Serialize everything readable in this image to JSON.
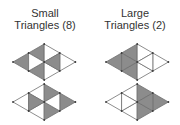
{
  "colors": {
    "shaded": "#8c8c8c",
    "unshaded": "#ffffff",
    "edge": "#707070",
    "vertex": "#3a3a3a",
    "text": "#333333"
  },
  "panels": [
    {
      "title": "Small",
      "subtitle": "Triangles (8)",
      "count": 8,
      "figures": [
        {
          "description": "rhombus of 8 small triangles; shaded: left tip, upper-left, lower-left, right-middle",
          "triangles": [
            {
              "id": 1,
              "fill": "#8c8c8c"
            },
            {
              "id": 2,
              "fill": "#8c8c8c"
            },
            {
              "id": 3,
              "fill": "#8c8c8c"
            },
            {
              "id": 4,
              "fill": "#ffffff"
            },
            {
              "id": 5,
              "fill": "#ffffff"
            },
            {
              "id": 6,
              "fill": "#ffffff"
            },
            {
              "id": 7,
              "fill": "#ffffff"
            },
            {
              "id": 8,
              "fill": "#8c8c8c"
            }
          ]
        },
        {
          "description": "rhombus of 8 small triangles; shaded: left-middle, right tip, upper-right, lower-right",
          "triangles": [
            {
              "id": 1,
              "fill": "#ffffff"
            },
            {
              "id": 2,
              "fill": "#ffffff"
            },
            {
              "id": 3,
              "fill": "#ffffff"
            },
            {
              "id": 4,
              "fill": "#8c8c8c"
            },
            {
              "id": 5,
              "fill": "#8c8c8c"
            },
            {
              "id": 6,
              "fill": "#8c8c8c"
            },
            {
              "id": 7,
              "fill": "#8c8c8c"
            },
            {
              "id": 8,
              "fill": "#ffffff"
            }
          ]
        }
      ]
    },
    {
      "title": "Large",
      "subtitle": "Triangles (2)",
      "count": 2,
      "figures": [
        {
          "description": "rhombus; left large triangle shaded",
          "triangles": [
            {
              "id": 1,
              "fill": "#8c8c8c"
            },
            {
              "id": 2,
              "fill": "#8c8c8c"
            },
            {
              "id": 3,
              "fill": "#8c8c8c"
            },
            {
              "id": 4,
              "fill": "#8c8c8c"
            },
            {
              "id": 5,
              "fill": "#ffffff"
            },
            {
              "id": 6,
              "fill": "#ffffff"
            },
            {
              "id": 7,
              "fill": "#ffffff"
            },
            {
              "id": 8,
              "fill": "#ffffff"
            }
          ]
        },
        {
          "description": "rhombus; right large triangle shaded",
          "triangles": [
            {
              "id": 1,
              "fill": "#ffffff"
            },
            {
              "id": 2,
              "fill": "#ffffff"
            },
            {
              "id": 3,
              "fill": "#ffffff"
            },
            {
              "id": 4,
              "fill": "#ffffff"
            },
            {
              "id": 5,
              "fill": "#8c8c8c"
            },
            {
              "id": 6,
              "fill": "#8c8c8c"
            },
            {
              "id": 7,
              "fill": "#8c8c8c"
            },
            {
              "id": 8,
              "fill": "#8c8c8c"
            }
          ]
        }
      ]
    }
  ]
}
